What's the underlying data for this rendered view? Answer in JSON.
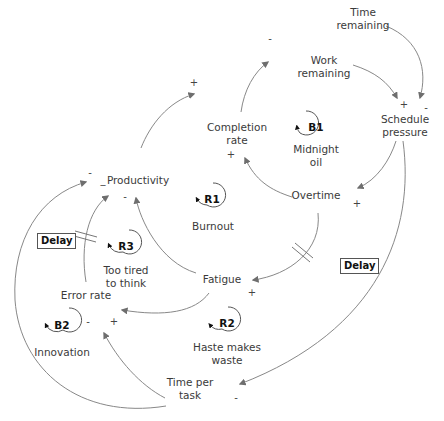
{
  "diagram": {
    "type": "causal-loop-diagram",
    "nodes": {
      "time_remaining": "Time\nremaining",
      "work_remaining": "Work\nremaining",
      "schedule_pressure": "Schedule\npressure",
      "completion_rate": "Completion\nrate",
      "productivity": "Productivity",
      "overtime": "Overtime",
      "fatigue": "Fatigue",
      "error_rate": "Error rate",
      "time_per_task": "Time per\ntask"
    },
    "loops": [
      {
        "id": "B1",
        "name": "Midnight\noil"
      },
      {
        "id": "R1",
        "name": "Burnout"
      },
      {
        "id": "R3",
        "name": "Too tired\nto think"
      },
      {
        "id": "B2",
        "name": "Innovation"
      },
      {
        "id": "R2",
        "name": "Haste makes\nwaste"
      }
    ],
    "delays": [
      {
        "label": "Delay",
        "link": "Overtime -> Fatigue"
      },
      {
        "label": "Delay",
        "link": "Error rate -> Productivity"
      }
    ],
    "links": [
      {
        "from": "Time remaining",
        "to": "Schedule pressure",
        "polarity": "-"
      },
      {
        "from": "Work remaining",
        "to": "Schedule pressure",
        "polarity": "+"
      },
      {
        "from": "Schedule pressure",
        "to": "Overtime",
        "polarity": "+"
      },
      {
        "from": "Schedule pressure",
        "to": "Time per task",
        "polarity": "-"
      },
      {
        "from": "Overtime",
        "to": "Completion rate",
        "polarity": "+"
      },
      {
        "from": "Completion rate",
        "to": "Work remaining",
        "polarity": "-"
      },
      {
        "from": "Productivity",
        "to": "Completion rate",
        "polarity": "+"
      },
      {
        "from": "Overtime",
        "to": "Fatigue",
        "polarity": "+"
      },
      {
        "from": "Fatigue",
        "to": "Productivity",
        "polarity": "-"
      },
      {
        "from": "Fatigue",
        "to": "Error rate",
        "polarity": "+"
      },
      {
        "from": "Error rate",
        "to": "Productivity",
        "polarity": "-"
      },
      {
        "from": "Time per task",
        "to": "Error rate",
        "polarity": "-"
      },
      {
        "from": "Time per task",
        "to": "Productivity",
        "polarity": "-"
      }
    ],
    "signs": {
      "s1": "-",
      "s2": "+",
      "s3": "-",
      "s4": "+",
      "s5": "-",
      "s6": "+",
      "s7": "+",
      "s8": "-",
      "s9": "_",
      "s10": "-",
      "s11": "+",
      "s12": "-",
      "s13": "+",
      "s14": "-"
    },
    "colors": {
      "line": "#777777",
      "arrowhead": "#6e6e6e",
      "text": "#3a3a3a",
      "loop_id": "#111111"
    }
  }
}
